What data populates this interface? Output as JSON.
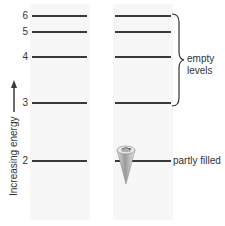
{
  "diagram": {
    "axis_label": "Increasing energy",
    "levels": [
      {
        "n": "6",
        "y": 16
      },
      {
        "n": "5",
        "y": 32
      },
      {
        "n": "4",
        "y": 57
      },
      {
        "n": "3",
        "y": 103
      },
      {
        "n": "2",
        "y": 161
      }
    ],
    "annotations": {
      "empty_levels_line1": "empty",
      "empty_levels_line2": "levels",
      "partly_filled": "partly filled"
    },
    "colors": {
      "line": "#3a3a3a",
      "column_bg": "#f7f7f7",
      "cone": "#b5b5b5"
    }
  }
}
